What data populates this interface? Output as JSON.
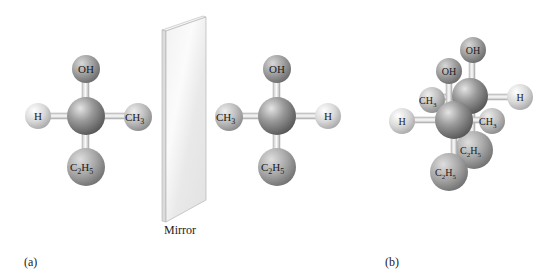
{
  "figure": {
    "mirror_label": "Mirror",
    "panel_a_label": "(a)",
    "panel_b_label": "(b)"
  },
  "molecules": {
    "left": {
      "center": "C",
      "top": "OH",
      "left": "H",
      "right": "CH",
      "right_sub": "3",
      "bottom_c": "C",
      "bottom_sub1": "2",
      "bottom_h": "H",
      "bottom_sub2": "5"
    },
    "right": {
      "center": "C",
      "top": "OH",
      "left": "CH",
      "left_sub": "3",
      "right": "H",
      "bottom_c": "C",
      "bottom_sub1": "2",
      "bottom_h": "H",
      "bottom_sub2": "5"
    },
    "overlay": {
      "back_top": "OH",
      "front_top": "OH",
      "back_left": "CH",
      "back_left_sub": "3",
      "back_right": "H",
      "front_left": "H",
      "front_right": "CH",
      "front_right_sub": "3",
      "back_bottom_c": "C",
      "back_bottom_sub1": "2",
      "back_bottom_h": "H",
      "back_bottom_sub2": "5",
      "front_bottom_c": "C",
      "front_bottom_sub1": "2",
      "front_bottom_h": "H",
      "front_bottom_sub2": "5"
    }
  },
  "colors": {
    "carbon": "#8a8a8a",
    "oh": "#9a9a9a",
    "h": "#d6d6d6",
    "ch3": "#b5b5b5",
    "c2h5": "#a0a0a0",
    "bond": "#e8e8e8",
    "mirror": "#ececec"
  }
}
